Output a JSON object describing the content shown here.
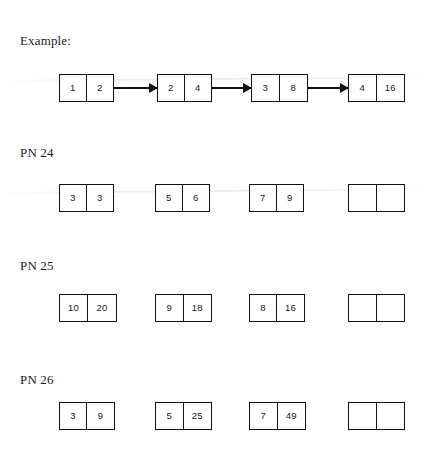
{
  "page": {
    "background_color": "#ffffff",
    "ink_color": "#111111"
  },
  "rows": [
    {
      "id": "example",
      "label": "Example:",
      "label_x": 20,
      "label_y": 33,
      "nodes_y": 74,
      "has_arrows": true,
      "nodes": [
        {
          "x": 59,
          "width": 55,
          "left": "1",
          "right": "2",
          "empty": false
        },
        {
          "x": 157,
          "width": 55,
          "left": "2",
          "right": "4",
          "empty": false
        },
        {
          "x": 251,
          "width": 57,
          "left": "3",
          "right": "8",
          "empty": false
        },
        {
          "x": 348,
          "width": 57,
          "left": "4",
          "right": "16",
          "empty": false
        }
      ],
      "arrows": [
        {
          "x": 114,
          "width": 43
        },
        {
          "x": 212,
          "width": 39
        },
        {
          "x": 308,
          "width": 40
        }
      ]
    },
    {
      "id": "pn-24",
      "label": "PN 24",
      "label_x": 20,
      "label_y": 145,
      "nodes_y": 184,
      "has_arrows": false,
      "nodes": [
        {
          "x": 59,
          "width": 55,
          "left": "3",
          "right": "3",
          "empty": false
        },
        {
          "x": 155,
          "width": 55,
          "left": "5",
          "right": "6",
          "empty": false
        },
        {
          "x": 249,
          "width": 55,
          "left": "7",
          "right": "9",
          "empty": false
        },
        {
          "x": 348,
          "width": 57,
          "left": "",
          "right": "",
          "empty": true
        }
      ],
      "arrows": []
    },
    {
      "id": "pn-25",
      "label": "PN 25",
      "label_x": 20,
      "label_y": 258,
      "nodes_y": 294,
      "has_arrows": false,
      "nodes": [
        {
          "x": 59,
          "width": 58,
          "left": "10",
          "right": "20",
          "empty": false
        },
        {
          "x": 155,
          "width": 57,
          "left": "9",
          "right": "18",
          "empty": false
        },
        {
          "x": 249,
          "width": 56,
          "left": "8",
          "right": "16",
          "empty": false
        },
        {
          "x": 348,
          "width": 57,
          "left": "",
          "right": "",
          "empty": true
        }
      ],
      "arrows": []
    },
    {
      "id": "pn-26",
      "label": "PN 26",
      "label_x": 20,
      "label_y": 372,
      "nodes_y": 402,
      "has_arrows": false,
      "nodes": [
        {
          "x": 59,
          "width": 56,
          "left": "3",
          "right": "9",
          "empty": false
        },
        {
          "x": 155,
          "width": 57,
          "left": "5",
          "right": "25",
          "empty": false
        },
        {
          "x": 249,
          "width": 57,
          "left": "7",
          "right": "49",
          "empty": false
        },
        {
          "x": 348,
          "width": 57,
          "left": "",
          "right": "",
          "empty": true
        }
      ],
      "arrows": []
    }
  ]
}
